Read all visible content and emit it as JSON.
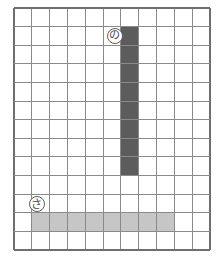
{
  "figure": {
    "title": "",
    "background_color": "#ffffff",
    "width": 224,
    "height": 259
  },
  "grid": {
    "columns": 11,
    "rows": 13,
    "origin_x": 14,
    "origin_y": 8,
    "cell_width": 17.82,
    "cell_height": 18.62,
    "line_color": "#8a8a8a",
    "outer_line_color": "#6f6f6f",
    "line_width": 1,
    "outer_line_width": 1.3
  },
  "bars": [
    {
      "id": "vertical-bar",
      "orientation": "vertical",
      "color": "#5c5c5c",
      "col_start": 6,
      "col_span": 1,
      "row_start": 1,
      "row_span": 8,
      "label": "vertical shaded column"
    },
    {
      "id": "horizontal-bar",
      "orientation": "horizontal",
      "color": "#c6c6c6",
      "col_start": 1,
      "col_span": 8,
      "row_start": 11,
      "row_span": 1,
      "label": "horizontal shaded row"
    }
  ],
  "markers": [
    {
      "id": "marker-vertical",
      "glyph": "の",
      "col": 6,
      "row": 1,
      "offset_x": -14,
      "offset_y": 1,
      "size": 16,
      "font_size": 11,
      "border_color": "#5f5f5f",
      "text_color": "#4a4a4a"
    },
    {
      "id": "marker-horizontal",
      "glyph": "さ",
      "col": 1,
      "row": 10,
      "offset_x": -3,
      "offset_y": 2,
      "size": 16,
      "font_size": 11,
      "border_color": "#5f5f5f",
      "text_color": "#4a4a4a"
    }
  ],
  "chart_data": {
    "type": "heatmap",
    "title": "",
    "xlabel": "",
    "ylabel": "",
    "grid": true,
    "legend": "none",
    "columns": 11,
    "rows": 13,
    "filled_cells": [
      {
        "col": 6,
        "row": 1,
        "color": "#5c5c5c"
      },
      {
        "col": 6,
        "row": 2,
        "color": "#5c5c5c"
      },
      {
        "col": 6,
        "row": 3,
        "color": "#5c5c5c"
      },
      {
        "col": 6,
        "row": 4,
        "color": "#5c5c5c"
      },
      {
        "col": 6,
        "row": 5,
        "color": "#5c5c5c"
      },
      {
        "col": 6,
        "row": 6,
        "color": "#5c5c5c"
      },
      {
        "col": 6,
        "row": 7,
        "color": "#5c5c5c"
      },
      {
        "col": 6,
        "row": 8,
        "color": "#5c5c5c"
      },
      {
        "col": 1,
        "row": 11,
        "color": "#c6c6c6"
      },
      {
        "col": 2,
        "row": 11,
        "color": "#c6c6c6"
      },
      {
        "col": 3,
        "row": 11,
        "color": "#c6c6c6"
      },
      {
        "col": 4,
        "row": 11,
        "color": "#c6c6c6"
      },
      {
        "col": 5,
        "row": 11,
        "color": "#c6c6c6"
      },
      {
        "col": 6,
        "row": 11,
        "color": "#c6c6c6"
      },
      {
        "col": 7,
        "row": 11,
        "color": "#c6c6c6"
      },
      {
        "col": 8,
        "row": 11,
        "color": "#c6c6c6"
      }
    ],
    "annotations": [
      {
        "text": "の",
        "col": 6,
        "row": 1,
        "style": "circled"
      },
      {
        "text": "さ",
        "col": 1,
        "row": 10,
        "style": "circled"
      }
    ]
  }
}
